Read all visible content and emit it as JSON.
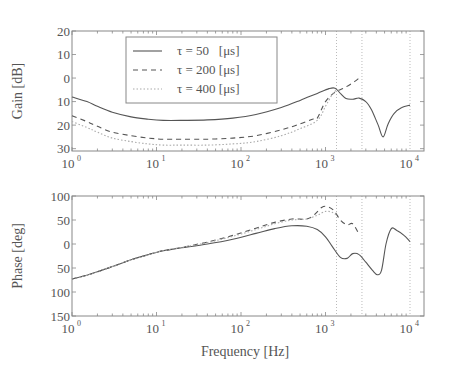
{
  "chart_data": [
    {
      "type": "line",
      "title": "",
      "xlabel": "",
      "ylabel": "Gain [dB]",
      "xscale": "log",
      "xlim": [
        1,
        10000
      ],
      "ylim": [
        -31,
        20
      ],
      "yticks": [
        20,
        10,
        0,
        -10,
        -20,
        -30
      ],
      "ytick_labels": [
        "20",
        "10",
        "0",
        "10",
        "20",
        "30"
      ],
      "xticks": [
        1,
        10,
        100,
        1000,
        10000
      ],
      "xtick_labels": [
        {
          "base": "10",
          "exp": "0"
        },
        {
          "base": "10",
          "exp": "1"
        },
        {
          "base": "10",
          "exp": "2"
        },
        {
          "base": "10",
          "exp": "3"
        },
        {
          "base": "10",
          "exp": "4"
        }
      ],
      "grid": false,
      "vlines": [
        1350,
        2700,
        10000
      ],
      "legend": {
        "position": "upper-center",
        "entries": [
          {
            "label": "τ = 50   [μs]",
            "style": "solid"
          },
          {
            "label": "τ = 200 [μs]",
            "style": "dashed"
          },
          {
            "label": "τ = 400 [μs]",
            "style": "dotted"
          }
        ]
      },
      "series": [
        {
          "name": "τ = 50 [μs]",
          "style": "solid",
          "x": [
            1,
            1.5,
            2,
            3,
            5,
            8,
            12,
            20,
            40,
            80,
            150,
            300,
            500,
            800,
            1100,
            1300,
            1500,
            1750,
            2100,
            2500,
            3000,
            3500,
            4200,
            4800,
            5500,
            6500,
            8000,
            10000
          ],
          "y": [
            -8,
            -10,
            -12,
            -14.5,
            -16.5,
            -17.5,
            -18,
            -18,
            -17.8,
            -17,
            -15.5,
            -12.5,
            -9.5,
            -6.5,
            -4.5,
            -4.3,
            -6.5,
            -8.7,
            -9,
            -8.5,
            -10,
            -13.5,
            -20,
            -25,
            -19.5,
            -15,
            -12.5,
            -11.5
          ]
        },
        {
          "name": "τ = 200 [μs]",
          "style": "dashed",
          "x": [
            1,
            1.5,
            2,
            3,
            5,
            8,
            12,
            20,
            40,
            80,
            150,
            300,
            500,
            700,
            800,
            1000,
            1300,
            1700,
            2200,
            2500
          ],
          "y": [
            -16,
            -18.5,
            -20.5,
            -23,
            -24.5,
            -25.5,
            -26,
            -26,
            -26,
            -25.5,
            -24.5,
            -22,
            -19.5,
            -17.5,
            -17,
            -10,
            -6,
            -4,
            -1.5,
            0
          ]
        },
        {
          "name": "τ = 400 [μs]",
          "style": "dotted",
          "x": [
            1,
            1.5,
            2,
            3,
            5,
            8,
            12,
            20,
            40,
            80,
            150,
            300,
            500,
            800,
            1000,
            1200,
            1350
          ],
          "y": [
            -18.5,
            -21,
            -23,
            -25.5,
            -27,
            -28,
            -28.5,
            -28.5,
            -28.5,
            -28,
            -27,
            -24.5,
            -21.5,
            -18,
            -12,
            -7,
            -5
          ]
        }
      ]
    },
    {
      "type": "line",
      "title": "",
      "xlabel": "Frequency [Hz]",
      "ylabel": "Phase [deg]",
      "xscale": "log",
      "xlim": [
        1,
        10000
      ],
      "ylim": [
        -150,
        100
      ],
      "yticks": [
        100,
        50,
        0,
        -50,
        -100,
        -150
      ],
      "ytick_labels": [
        "100",
        "50",
        "0",
        "50",
        "100",
        "150"
      ],
      "xticks": [
        1,
        10,
        100,
        1000,
        10000
      ],
      "xtick_labels": [
        {
          "base": "10",
          "exp": "0"
        },
        {
          "base": "10",
          "exp": "1"
        },
        {
          "base": "10",
          "exp": "2"
        },
        {
          "base": "10",
          "exp": "3"
        },
        {
          "base": "10",
          "exp": "4"
        }
      ],
      "grid": false,
      "vlines": [
        1350,
        2700,
        10000
      ],
      "series": [
        {
          "name": "τ = 50 [μs]",
          "style": "solid",
          "x": [
            1,
            1.5,
            2,
            3,
            5,
            8,
            12,
            20,
            40,
            80,
            150,
            250,
            400,
            600,
            800,
            1000,
            1200,
            1500,
            1800,
            2100,
            2500,
            3000,
            3600,
            4100,
            4600,
            5200,
            6000,
            7000,
            8500,
            10000
          ],
          "y": [
            -73,
            -65,
            -58,
            -47,
            -33,
            -22,
            -14,
            -8,
            0,
            10,
            22,
            32,
            38,
            37,
            30,
            15,
            -5,
            -28,
            -30,
            -20,
            -22,
            -38,
            -55,
            -64,
            -55,
            0,
            32,
            28,
            18,
            5
          ]
        },
        {
          "name": "τ = 200 [μs]",
          "style": "dashed",
          "x": [
            1,
            1.5,
            2,
            3,
            5,
            8,
            12,
            20,
            40,
            80,
            150,
            250,
            400,
            600,
            750,
            900,
            1050,
            1250,
            1500,
            1800,
            2100,
            2500
          ],
          "y": [
            -73,
            -65,
            -58,
            -47,
            -33,
            -22,
            -14,
            -7,
            4,
            18,
            33,
            45,
            52,
            52,
            62,
            76,
            78,
            70,
            50,
            40,
            42,
            20
          ]
        },
        {
          "name": "τ = 400 [μs]",
          "style": "dotted",
          "x": [
            1,
            1.5,
            2,
            3,
            5,
            8,
            12,
            20,
            40,
            80,
            150,
            250,
            400,
            600,
            800,
            1000,
            1200,
            1350
          ],
          "y": [
            -73,
            -65,
            -58,
            -47,
            -33,
            -22,
            -14,
            -7,
            3,
            16,
            30,
            42,
            50,
            52,
            60,
            68,
            66,
            60
          ]
        }
      ]
    }
  ],
  "panels": {
    "top": {
      "ylabel": "Gain [dB]"
    },
    "bottom": {
      "ylabel": "Phase [deg]",
      "xlabel": "Frequency [Hz]"
    }
  },
  "colors": {
    "line": "#555555",
    "axes": "#888888",
    "vline": "#bbbbbb",
    "text": "#555555"
  }
}
